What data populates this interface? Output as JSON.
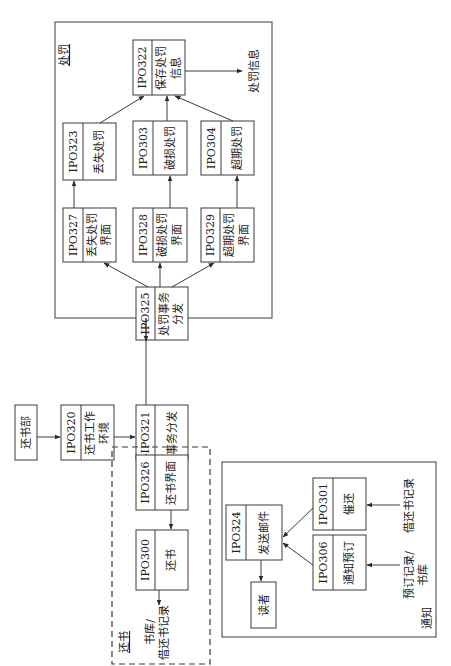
{
  "diagram": {
    "orientation": "rotated-90-ccw",
    "groups": {
      "penalty": {
        "title": "处罚",
        "border": "solid"
      },
      "return": {
        "title": "还书",
        "border": "dashed"
      },
      "notice": {
        "title": "通知",
        "border": "solid"
      }
    },
    "nodes": {
      "dept": {
        "name": "还书部"
      },
      "ipo320": {
        "id": "IPO320",
        "line1": "还书工作",
        "line2": "环境"
      },
      "ipo321": {
        "id": "IPO321",
        "line1": "事务分发",
        "line2": ""
      },
      "ipo325": {
        "id": "IPO325",
        "line1": "处罚事务",
        "line2": "分发"
      },
      "ipo327": {
        "id": "IPO327",
        "line1": "丢失处罚",
        "line2": "界面"
      },
      "ipo328": {
        "id": "IPO328",
        "line1": "破损处罚",
        "line2": "界面"
      },
      "ipo329": {
        "id": "IPO329",
        "line1": "超期处罚",
        "line2": "界面"
      },
      "ipo323": {
        "id": "IPO323",
        "line1": "丢失处罚",
        "line2": ""
      },
      "ipo303": {
        "id": "IPO303",
        "line1": "破损处罚",
        "line2": ""
      },
      "ipo304": {
        "id": "IPO304",
        "line1": "超期处罚",
        "line2": ""
      },
      "ipo322": {
        "id": "IPO322",
        "line1": "保存处罚",
        "line2": "信息"
      },
      "ipo326": {
        "id": "IPO326",
        "line1": "还书界面",
        "line2": ""
      },
      "ipo300": {
        "id": "IPO300",
        "line1": "还书",
        "line2": ""
      },
      "ipo324": {
        "id": "IPO324",
        "line1": "发送邮件",
        "line2": ""
      },
      "reader": {
        "name": "读者"
      },
      "ipo301": {
        "id": "IPO301",
        "line1": "催还",
        "line2": ""
      },
      "ipo306": {
        "id": "IPO306",
        "line1": "通知预订",
        "line2": ""
      }
    },
    "labels": {
      "penalty_output": "处罚信息",
      "return_output_line1": "书库/",
      "return_output_line2": "借还书记录",
      "reserve_input_line1": "预订记录/",
      "reserve_input_line2": "书库",
      "borrow_input": "借还书记录"
    },
    "edges": [
      [
        "还书部",
        "IPO320"
      ],
      [
        "IPO320",
        "IPO321"
      ],
      [
        "IPO321",
        "IPO325"
      ],
      [
        "IPO321",
        "IPO326"
      ],
      [
        "IPO325",
        "IPO327"
      ],
      [
        "IPO325",
        "IPO328"
      ],
      [
        "IPO325",
        "IPO329"
      ],
      [
        "IPO327",
        "IPO323"
      ],
      [
        "IPO328",
        "IPO303"
      ],
      [
        "IPO329",
        "IPO304"
      ],
      [
        "IPO323",
        "IPO322"
      ],
      [
        "IPO303",
        "IPO322"
      ],
      [
        "IPO304",
        "IPO322"
      ],
      [
        "IPO322",
        "处罚信息"
      ],
      [
        "IPO326",
        "IPO300"
      ],
      [
        "IPO300",
        "书库/借还书记录"
      ],
      [
        "借还书记录",
        "IPO301"
      ],
      [
        "预订记录/书库",
        "IPO306"
      ],
      [
        "IPO301",
        "IPO324"
      ],
      [
        "IPO306",
        "IPO324"
      ],
      [
        "IPO324",
        "读者"
      ]
    ]
  }
}
